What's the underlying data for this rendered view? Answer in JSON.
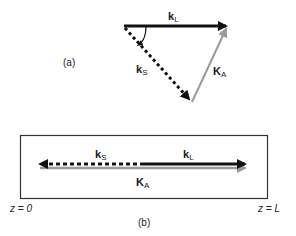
{
  "panel_a": {
    "label": "(a)",
    "vectors": {
      "k_L": {
        "main": "k",
        "sub": "L",
        "style": "solid",
        "color": "#111111"
      },
      "k_S": {
        "main": "k",
        "sub": "S",
        "style": "dotted",
        "color": "#111111"
      },
      "K_A": {
        "main": "K",
        "sub": "A",
        "style": "solid",
        "color": "#9a9a9a"
      }
    }
  },
  "panel_b": {
    "label": "(b)",
    "left_boundary": "z = 0",
    "right_boundary": "z = L",
    "vectors": {
      "k_L": {
        "main": "k",
        "sub": "L",
        "style": "solid",
        "color": "#111111"
      },
      "k_S": {
        "main": "k",
        "sub": "S",
        "style": "dotted",
        "color": "#111111"
      },
      "K_A": {
        "main": "K",
        "sub": "A",
        "style": "solid",
        "color": "#9a9a9a"
      }
    }
  }
}
